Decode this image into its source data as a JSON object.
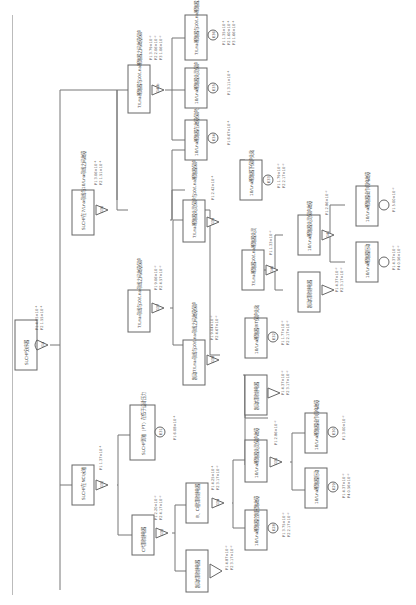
{
  "diagram": {
    "type": "fault-tree",
    "root": {
      "label": "SLCHF分序器",
      "gate": "G4",
      "gate_type": "AND",
      "probs": [
        "P1 4.85×10⁻¹",
        "P2 1.55×10⁻¹"
      ]
    },
    "nodes": [
      {
        "id": "G32",
        "label": "SLCHF在NCI水箱",
        "probs": [
          "P1 1.37×10⁻¹"
        ],
        "gate_type": "AND"
      },
      {
        "id": "E31",
        "label": "SLCHF到箱（PT）在低于设计压力",
        "probs": [
          "P1 6.08×10⁻¹"
        ],
        "kind": "basic"
      },
      {
        "id": "G33",
        "label": "CF切除继电器",
        "probs": [
          "P1 2.20×10⁻²",
          "P2 4.17×10⁻²"
        ],
        "gate_type": "AND"
      },
      {
        "id": "X1",
        "label": "制动切除继电器",
        "probs": [
          "P1 4.87×10⁻²",
          "P2 3.17×10⁻²"
        ],
        "kind": "transfer"
      },
      {
        "id": "G34",
        "label": "B、C相切除继电器",
        "probs": [
          "P1 4.25×10⁻¹",
          "P2 3.17×10⁻²"
        ],
        "gate_type": "AND"
      },
      {
        "id": "E28",
        "label": "10/Lna断路器控制回路故障",
        "probs": [
          "P1 3.75×10⁻²",
          "P2 2.17×10⁻²"
        ],
        "kind": "basic"
      },
      {
        "id": "G35",
        "label": "10/Lna断路器失灵保护故障",
        "probs": [
          "P1 2.86×10⁻²"
        ],
        "gate_type": "AND"
      },
      {
        "id": "E29",
        "label": "10/Lna断路器拒动",
        "probs": [
          "P1 4.37×10⁻²",
          "P4 0.56×10⁻²"
        ],
        "kind": "basic"
      },
      {
        "id": "E30",
        "label": "10/Lna断路器操作机构故障",
        "probs": [
          "P1 3.00×10⁻²"
        ],
        "kind": "basic"
      },
      {
        "id": "G36",
        "label": "SLCHF在7/Lna母线与10/Lna母线之间故障",
        "probs": [
          "P1 3.06×10⁻¹",
          "P2 1.51×10⁻¹"
        ],
        "gate_type": "AND"
      },
      {
        "id": "G37",
        "label": "7/Lna母线与10/Lna母线之间故障保护",
        "probs": [
          "P1 9.06×10⁻²",
          "P2 4.57×10⁻²"
        ],
        "gate_type": "OR"
      },
      {
        "id": "G38",
        "label": "制动7/Lna母线与10/Lna母线之间故障保护",
        "probs": [
          "P1 9.04×10⁻²",
          "P2 4.67×10⁻²"
        ],
        "gate_type": "AND"
      },
      {
        "id": "X2",
        "label": "制动切除继电器",
        "probs": [
          "P1 4.37×10⁻²",
          "P2 3.17×10⁻²"
        ],
        "kind": "transfer"
      },
      {
        "id": "E32",
        "label": "10/Lna断路器BIT保护失效",
        "probs": [
          "P1 1.77×10⁻²",
          "P2 2.17×10⁻²"
        ],
        "kind": "basic"
      },
      {
        "id": "G39",
        "label": "7/Lna断路器失灵保护与10/Lna断路器保护",
        "probs": [
          "P1 2.42×10⁻¹"
        ],
        "gate_type": "AND"
      },
      {
        "id": "G40",
        "label": "7/Lna断路器10/Lna断路器失灵",
        "probs": [
          "P1 1.33×10⁻²"
        ],
        "gate_type": "AND"
      },
      {
        "id": "X3",
        "label": "制动切除继电器",
        "probs": [
          "P1 4.37×10⁻²",
          "P2 3.17×10⁻²"
        ],
        "kind": "transfer"
      },
      {
        "id": "G41",
        "label": "10/Lna断路器失灵保护故障",
        "probs": [
          "P1 2.86×10⁻²"
        ],
        "gate_type": "AND"
      },
      {
        "id": "E29b",
        "label": "10/Lna断路器拒动",
        "probs": [
          "P1 4.37×10⁻²",
          "P4 0.56×10⁻²"
        ],
        "kind": "basic"
      },
      {
        "id": "E30b",
        "label": "10/Lna断路器操作机构故障",
        "probs": [
          "P1 5.00×10⁻²"
        ],
        "kind": "basic"
      },
      {
        "id": "E33",
        "label": "10/Lna断路器下保护失效",
        "probs": [
          "P1 1.79×10⁻²",
          "P2 2.17×10⁻²"
        ],
        "kind": "basic"
      },
      {
        "id": "G41b",
        "label": "7/Lna断路器与10/Lna断路器之间故障保护",
        "probs": [
          "P1 3.79×10⁻²",
          "P2 2.06×10⁻²",
          "P3 1.06×10⁻²"
        ],
        "gate_type": "AND"
      },
      {
        "id": "E34",
        "label": "10/Lna断路器在故障保护出口（TT）",
        "probs": [
          "P1 6.67×10⁻¹"
        ],
        "kind": "basic"
      },
      {
        "id": "E35",
        "label": "10/Lna断路器失灵保护（PT）",
        "probs": [
          "P1 3.11×10⁻¹"
        ],
        "kind": "basic"
      },
      {
        "id": "E36",
        "label": "7/Lna断路器与10/Lna断路器之间故障",
        "probs": [
          "P1 1.35×10⁻¹",
          "P2 1.60×10⁻¹",
          "P3 1.66×10⁻¹"
        ],
        "kind": "basic"
      }
    ]
  }
}
